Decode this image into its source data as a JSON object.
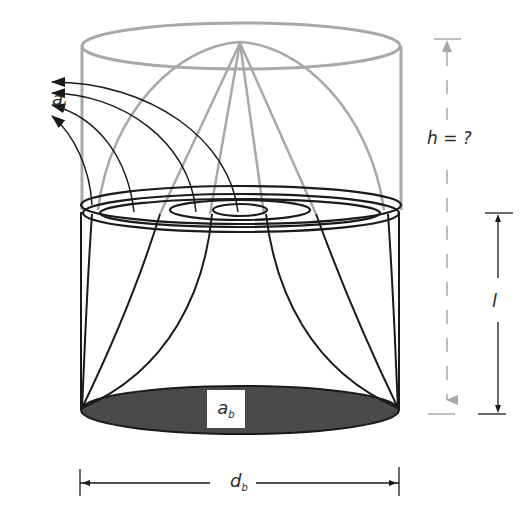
{
  "figure": {
    "colors": {
      "background": "#ffffff",
      "ink": "#1a1a1a",
      "gray_lines": "#a8a8a8",
      "base_fill": "#4a4a4a"
    }
  },
  "labels": {
    "a_l": {
      "main": "a",
      "sub": "l"
    },
    "h": "h = ?",
    "l": "l",
    "a_b": {
      "main": "a",
      "sub": "b"
    },
    "d_b": {
      "main": "d",
      "sub": "b"
    }
  },
  "dimensions": [
    {
      "name": "h",
      "text": "h = ?",
      "style": "dashed-gray",
      "orientation": "vertical"
    },
    {
      "name": "l",
      "text": "l",
      "style": "solid-black",
      "orientation": "vertical"
    },
    {
      "name": "d_b",
      "text": "d_b",
      "style": "solid-black",
      "orientation": "horizontal"
    }
  ]
}
